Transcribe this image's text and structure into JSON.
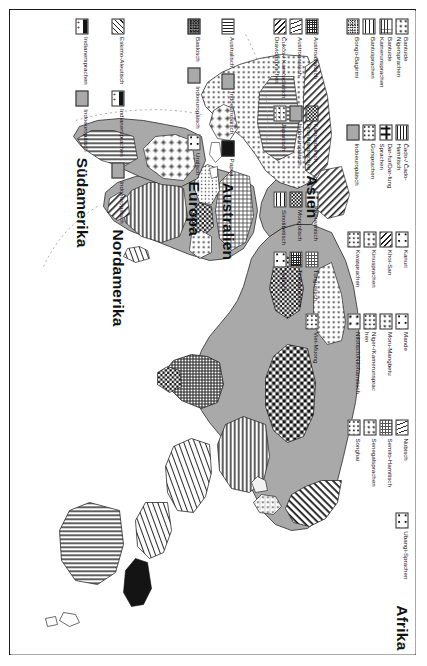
{
  "poster": {
    "orientation": "rotated-90"
  },
  "legends": [
    {
      "id": "afrika",
      "title": "Afrika",
      "entries": [
        {
          "label": "Bantuide Nigersprachen",
          "pattern": "p-d2"
        },
        {
          "label": "Bantuide Kamerunsprachen",
          "pattern": "p-gridline"
        },
        {
          "label": "Bantusprachen",
          "pattern": "p-hline-w"
        },
        {
          "label": "Bongo-Bagirmi",
          "pattern": "p-noise"
        },
        {
          "label": "Čado-/ Čado-Hamitisch",
          "pattern": "p-hline"
        },
        {
          "label": "Dar-fur/Dar-fung Sprachen",
          "pattern": "p-plus"
        },
        {
          "label": "Gursprachen",
          "pattern": "p-d3"
        },
        {
          "label": "Indoeuropäisch",
          "pattern": "p-solidgrey"
        },
        {
          "label": "Kanuri",
          "pattern": "p-d1"
        },
        {
          "label": "Khoi-San",
          "pattern": "p-diag"
        },
        {
          "label": "Kinusprachen",
          "pattern": "p-d2"
        },
        {
          "label": "Kwasprachen",
          "pattern": "p-d3"
        },
        {
          "label": "Mande",
          "pattern": "p-d1"
        },
        {
          "label": "Moru-Mangbetu",
          "pattern": "p-d2"
        },
        {
          "label": "Niger-/Kamerunsprachen",
          "pattern": "p-d3"
        },
        {
          "label": "Nilotisch/Nilohamitisch",
          "pattern": "p-d4"
        },
        {
          "label": "Nubisch",
          "pattern": "p-wave"
        },
        {
          "label": "Semito-Hamitisch",
          "pattern": "p-grid"
        },
        {
          "label": "Senegalsprachen",
          "pattern": "p-d2"
        },
        {
          "label": "Songhai",
          "pattern": "p-d3"
        },
        {
          "label": "Ubangi-Sprachen",
          "pattern": "p-d1"
        }
      ]
    },
    {
      "id": "asien",
      "title": "Asien",
      "entries": [
        {
          "label": "Austroasiatisch",
          "pattern": "p-grid-d"
        },
        {
          "label": "Austronesisch",
          "pattern": "p-wave"
        },
        {
          "label": "Čukčo-/ Kamčadalisch Dravidasprachen",
          "pattern": "p-diag"
        },
        {
          "label": "Kamčadalisch Dravidasprachen",
          "pattern": "p-check-s"
        },
        {
          "label": "Indoeuropäisch",
          "pattern": "p-solidgrey"
        },
        {
          "label": "Japanisch",
          "pattern": "p-dotline"
        },
        {
          "label": "Koreanisch",
          "pattern": "p-white"
        },
        {
          "label": "Mongolisch",
          "pattern": "p-check-s"
        },
        {
          "label": "Sinotibetisch",
          "pattern": "p-hline-w"
        },
        {
          "label": "Tungusisch",
          "pattern": "p-grid"
        },
        {
          "label": "Türksprachen",
          "pattern": "p-grid-d"
        },
        {
          "label": "Uralisch",
          "pattern": "p-d1"
        },
        {
          "label": "Viet-Muong",
          "pattern": "p-d3"
        }
      ]
    },
    {
      "id": "australien",
      "title": "Australien",
      "entries": [
        {
          "label": "Australisch",
          "pattern": "p-vline"
        },
        {
          "label": "Indoeuropäisch",
          "pattern": "p-solidgrey"
        },
        {
          "label": "Papua",
          "pattern": "p-papua"
        }
      ]
    },
    {
      "id": "europa",
      "title": "Europa",
      "entries": [
        {
          "label": "Baskisch",
          "pattern": "p-basque"
        },
        {
          "label": "Indoeuropäisch",
          "pattern": "p-solidgrey"
        },
        {
          "label": "Uralisch",
          "pattern": "p-d1"
        }
      ]
    },
    {
      "id": "nordamerika",
      "title": "Nordamerika",
      "entries": [
        {
          "label": "Eskimo-Aleutisch",
          "pattern": "p-esk"
        },
        {
          "label": "Indianersprachen",
          "pattern": "p-indian"
        },
        {
          "label": "Indoeuropäisch",
          "pattern": "p-solidgrey"
        }
      ]
    },
    {
      "id": "suedamerika",
      "title": "Südamerika",
      "entries": [
        {
          "label": "Indianersprachen",
          "pattern": "p-indian"
        },
        {
          "label": "Indoeuropäisch",
          "pattern": "p-solidgrey"
        }
      ]
    }
  ],
  "colors": {
    "frame": "#1a1a1a",
    "land_grey": "#a9a9a9",
    "ink": "#111111",
    "paper": "#ffffff"
  }
}
